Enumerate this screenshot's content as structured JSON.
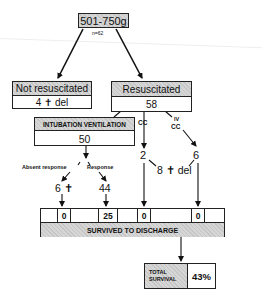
{
  "root": {
    "label": "501-750g",
    "n_label": "n=62"
  },
  "not_resuscitated": {
    "title": "Not resuscitated",
    "value": "4 ✝ del"
  },
  "resuscitated": {
    "title": "Resuscitated",
    "value": "58"
  },
  "intubation": {
    "title": "INTUBATION VENTILATION",
    "value": "50"
  },
  "cc_branch": {
    "label": "CC",
    "value": "2"
  },
  "iv_cc_branch": {
    "label_line1": "IV",
    "label_line2": "CC",
    "value": "6"
  },
  "cc_deaths": {
    "value": "8 ✝ del"
  },
  "absent_response": {
    "label": "Absent response",
    "value": "6 ✝"
  },
  "response": {
    "label": "Response",
    "value": "44"
  },
  "survived": {
    "title": "SURVIVED TO DISCHARGE",
    "cells": [
      "0",
      "25",
      "0",
      "0"
    ]
  },
  "total_survival": {
    "label_line1": "TOTAL",
    "label_line2": "SURVIVAL",
    "value": "43%"
  }
}
